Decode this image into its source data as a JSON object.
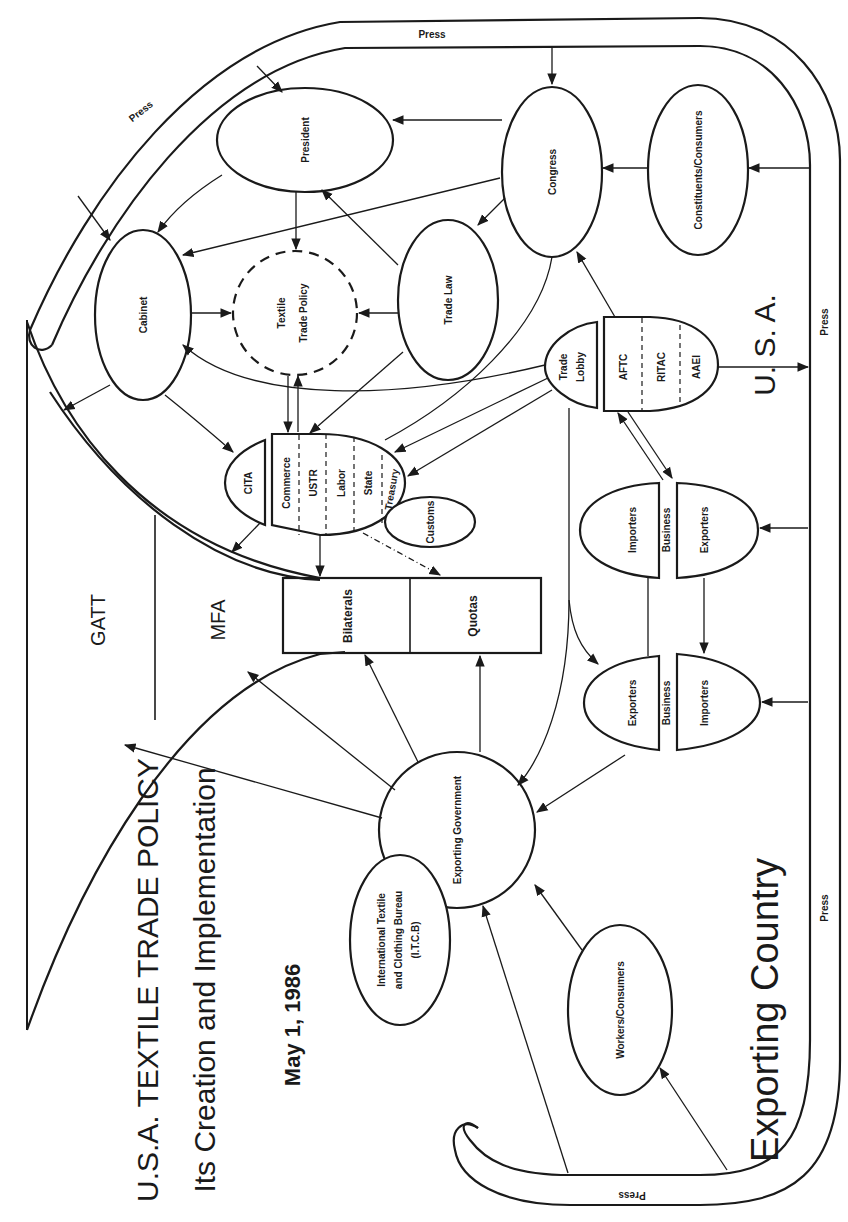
{
  "diagram": {
    "title": "U.S.A. TEXTILE TRADE POLICY",
    "subtitle": "Its Creation and Implementation",
    "date": "May 1, 1986",
    "regions": {
      "usa": "U.  S.  A.",
      "exporting_country": "Exporting Country"
    },
    "press_labels": {
      "top": "Press",
      "top_left_arc": "Press",
      "right_usa": "Press",
      "right_exporting": "Press",
      "bottom_arc": "Press"
    },
    "nodes": {
      "president": "President",
      "congress": "Congress",
      "constituents": "Constituents/Consumers",
      "cabinet": "Cabinet",
      "textile_trade_policy_line1": "Textile",
      "textile_trade_policy_line2": "Trade Policy",
      "trade_law": "Trade Law",
      "trade_lobby_line1": "Trade",
      "trade_lobby_line2": "Lobby",
      "aftc": "AFTC",
      "ritac": "RITAC",
      "aaei": "AAEI",
      "cita": "CITA",
      "commerce": "Commerce",
      "ustr": "USTR",
      "labor": "Labor",
      "state": "State",
      "treasury": "Treasury",
      "customs": "Customs",
      "gatt": "GATT",
      "mfa": "MFA",
      "bilaterals": "Bilaterals",
      "quotas": "Quotas",
      "us_importers": "Importers",
      "us_exporters": "Exporters",
      "us_business": "Business",
      "ex_exporters": "Exporters",
      "ex_importers": "Importers",
      "ex_business": "Business",
      "exporting_government": "Exporting Government",
      "itcb_line1": "International Textile",
      "itcb_line2": "and Clothing Bureau",
      "itcb_line3": "(I.T.C.B)",
      "workers_consumers": "Workers/Consumers"
    }
  }
}
